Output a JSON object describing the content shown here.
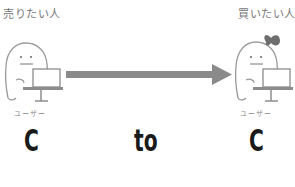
{
  "diagram": {
    "seller": {
      "title": "売りたい人",
      "role": "ユーザー",
      "letter": "C"
    },
    "connector": "to",
    "buyer": {
      "title": "買いたい人",
      "role": "ユーザー",
      "letter": "C"
    },
    "arrow": {
      "direction": "right",
      "color": "#8a8a8a"
    },
    "colors": {
      "text_dark": "#1a1a1a",
      "text_gray": "#777777",
      "line_gray": "#999999"
    }
  }
}
